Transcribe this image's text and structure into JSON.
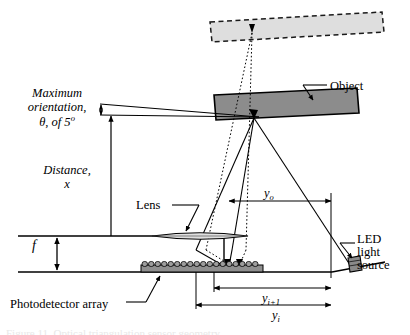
{
  "figure": {
    "labels": {
      "max_orientation_line1": "Maximum",
      "max_orientation_line2": "orientation,",
      "max_orientation_line3_prefix": "θ, of 5",
      "max_orientation_degree": "o",
      "distance_line1": "Distance,",
      "distance_line2": "x",
      "focal_length": "f",
      "lens": "Lens",
      "object": "Object",
      "led_line1": "LED",
      "led_line2": "light",
      "led_line3": "source",
      "photodetector_array": "Photodetector array",
      "y_object": "y",
      "y_object_sub": "o",
      "y_image_next": "y",
      "y_image_next_sub": "i+1",
      "y_image": "y",
      "y_image_sub": "i"
    },
    "caption_clipped": "Figure 11. Optical triangulation sensor geometry.",
    "colors": {
      "stroke": "#000000",
      "object_fill": "#8c8c8c",
      "object_ghost_fill": "#dedede",
      "detector_fill": "#9a9a9a",
      "lens_fill": "#e0e0e0",
      "led_fill": "#8a8a8a",
      "background": "#ffffff"
    }
  }
}
